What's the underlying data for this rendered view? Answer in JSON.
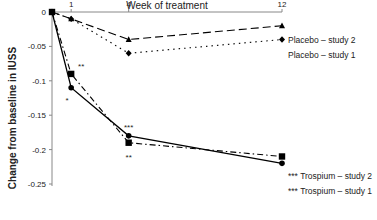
{
  "chart_data": {
    "type": "line",
    "title": "",
    "xlabel": "Week of treatment",
    "ylabel": "Change from baseline in IUSS",
    "x": [
      0,
      1,
      4,
      12
    ],
    "x_tick_labels": [
      "1",
      "4",
      "12"
    ],
    "x_ticks": [
      1,
      4,
      12
    ],
    "y_tick_labels": [
      "0",
      "-0.05",
      "-0.1",
      "-0.15",
      "-0.2",
      "-0.25"
    ],
    "y_ticks": [
      0,
      -0.05,
      -0.1,
      -0.15,
      -0.2,
      -0.25
    ],
    "ylim": [
      -0.25,
      0
    ],
    "xlim": [
      0,
      12
    ],
    "x_axis_position": "top",
    "grid": false,
    "legend_position": "inline-right",
    "series": [
      {
        "name": "Placebo – study 2",
        "values": [
          0,
          -0.01,
          -0.04,
          -0.02
        ],
        "marker": "triangle",
        "line": "dashed",
        "annotations": []
      },
      {
        "name": "Placebo – study 1",
        "values": [
          0,
          -0.01,
          -0.06,
          -0.04
        ],
        "marker": "diamond",
        "line": "dotted",
        "annotations": []
      },
      {
        "name": "Trospium – study 2",
        "values": [
          0,
          -0.09,
          -0.19,
          -0.21
        ],
        "marker": "square",
        "line": "dash-dot",
        "annotations": [
          "",
          "**",
          "**",
          "***"
        ]
      },
      {
        "name": "Trospium – study 1",
        "values": [
          0,
          -0.11,
          -0.18,
          -0.22
        ],
        "marker": "circle",
        "line": "solid",
        "annotations": [
          "",
          "*",
          "***",
          "***"
        ]
      }
    ]
  }
}
